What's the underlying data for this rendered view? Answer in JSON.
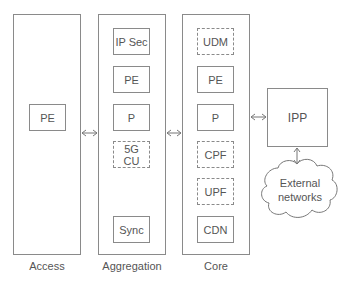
{
  "columns": [
    {
      "id": "access",
      "label": "Access",
      "boxes": [
        {
          "label": "PE",
          "style": "solid"
        }
      ]
    },
    {
      "id": "aggregation",
      "label": "Aggregation",
      "boxes": [
        {
          "label": "IP Sec",
          "style": "solid"
        },
        {
          "label": "PE",
          "style": "solid"
        },
        {
          "label": "P",
          "style": "solid"
        },
        {
          "label": "5G CU",
          "style": "dashed"
        },
        {
          "label": "Sync",
          "style": "solid"
        }
      ]
    },
    {
      "id": "core",
      "label": "Core",
      "boxes": [
        {
          "label": "UDM",
          "style": "dashed"
        },
        {
          "label": "PE",
          "style": "solid"
        },
        {
          "label": "P",
          "style": "solid"
        },
        {
          "label": "CPF",
          "style": "dashed"
        },
        {
          "label": "UPF",
          "style": "dashed"
        },
        {
          "label": "CDN",
          "style": "solid"
        }
      ]
    }
  ],
  "ipp": {
    "label": "IPP"
  },
  "cloud": {
    "line1": "External",
    "line2": "networks"
  },
  "connections": [
    {
      "from": "access",
      "to": "aggregation",
      "type": "bidirectional"
    },
    {
      "from": "aggregation",
      "to": "core",
      "type": "bidirectional"
    },
    {
      "from": "core",
      "to": "ipp",
      "type": "bidirectional"
    },
    {
      "from": "ipp",
      "to": "external-networks",
      "type": "bidirectional"
    }
  ]
}
